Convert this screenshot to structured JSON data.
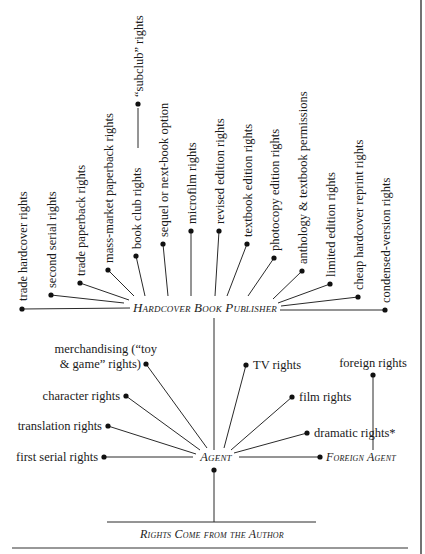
{
  "diagram": {
    "type": "rights-flow-tree",
    "publisher": {
      "label": "Hardcover Book Publisher"
    },
    "agent": {
      "label": "Agent"
    },
    "foreign_agent": {
      "label": "Foreign Agent"
    },
    "author": {
      "label": "Rights Come from the Author"
    },
    "publisher_rights": [
      "trade hardcover rights",
      "second serial rights",
      "trade paperback rights",
      "mass-market paperback rights",
      "book club rights",
      "sequel or next-book option",
      "microfilm rights",
      "revised edition rights",
      "textbook edition rights",
      "photocopy edition rights",
      "anthology & textbook permissions",
      "limited edition rights",
      "cheap hardcover reprint rights",
      "condensed-version rights"
    ],
    "book_club_sub": "“subclub” rights",
    "agent_rights_left": {
      "merchandising_line1": "merchandising (“toy",
      "merchandising_line2": "& game” rights)",
      "character": "character rights",
      "translation": "translation rights",
      "first_serial": "first serial rights"
    },
    "agent_rights_right": {
      "tv": "TV rights",
      "film": "film rights",
      "dramatic": "dramatic rights*"
    },
    "foreign_agent_rights": {
      "foreign": "foreign rights"
    },
    "edges": [
      [
        "Author",
        "Agent"
      ],
      [
        "Agent",
        "Hardcover Book Publisher"
      ],
      [
        "Agent",
        "Foreign Agent"
      ],
      [
        "Foreign Agent",
        "foreign rights"
      ],
      [
        "book club rights",
        "“subclub” rights"
      ]
    ]
  }
}
